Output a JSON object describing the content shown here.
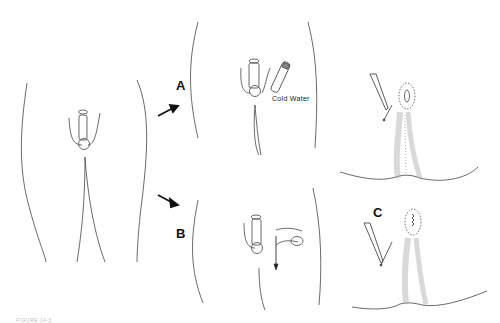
{
  "figure": {
    "caption": "FIGURE 14-3",
    "panels": [
      {
        "id": "main",
        "description": "Anterior view of male pelvis with penis in elongated/erect state"
      },
      {
        "id": "A",
        "label": "A",
        "annotation": "Cold Water",
        "description": "Application of cold water to penis"
      },
      {
        "id": "B",
        "label": "B",
        "description": "Manual traction with downward arrow"
      },
      {
        "id": "top-right",
        "description": "Perineal view with needle approaching dotted-circled lesion"
      },
      {
        "id": "C",
        "label": "C",
        "description": "Perineal view with needle, sutured lesion inside dotted oval"
      }
    ]
  },
  "colors": {
    "line": "#333333",
    "hair": "#9a9a9a",
    "background": "#ffffff"
  }
}
